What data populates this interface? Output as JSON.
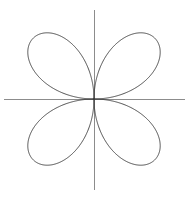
{
  "figure": {
    "title": "",
    "background_color": "#ffffff",
    "width": 189,
    "height": 197
  },
  "chart_data": {
    "type": "line",
    "title": "",
    "subtitle": "",
    "xlabel": "",
    "ylabel": "",
    "curve_name": "four-petaled rose (quadrifolium)",
    "polar_equation": "r = a*sin(2*theta)",
    "petal_count": 4,
    "amplitude_a": 86,
    "center": {
      "x": 94,
      "y": 99
    },
    "petal_orientation_degrees": [
      45,
      135,
      225,
      315
    ],
    "axis_ranges": {
      "x_pixels": [
        4,
        185
      ],
      "y_pixels": [
        10,
        190
      ]
    },
    "grid": false,
    "legend": "none",
    "legend_entries": [],
    "tick_labels": {
      "x": [],
      "y": []
    },
    "annotations": [],
    "series": [
      {
        "name": "petal-upper-left",
        "tip_pixel": {
          "x": 27,
          "y": 37
        },
        "extent_pixels": {
          "left": 12,
          "top": 12,
          "right": 94,
          "bottom": 99
        }
      },
      {
        "name": "petal-upper-right",
        "tip_pixel": {
          "x": 161,
          "y": 37
        },
        "extent_pixels": {
          "left": 94,
          "top": 12,
          "right": 177,
          "bottom": 99
        }
      },
      {
        "name": "petal-lower-right",
        "tip_pixel": {
          "x": 161,
          "y": 161
        },
        "extent_pixels": {
          "left": 94,
          "top": 99,
          "right": 177,
          "bottom": 186
        }
      },
      {
        "name": "petal-lower-left",
        "tip_pixel": {
          "x": 27,
          "y": 161
        },
        "extent_pixels": {
          "left": 12,
          "top": 99,
          "right": 94,
          "bottom": 186
        }
      }
    ],
    "colors": {
      "curve": "#3a3a3a",
      "axis": "#8c8c8c",
      "background": "#ffffff"
    }
  },
  "axes": {
    "horizontal_label": "",
    "vertical_label": "",
    "origin_label": ""
  }
}
